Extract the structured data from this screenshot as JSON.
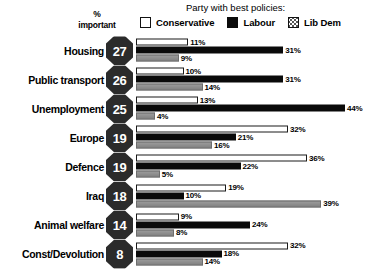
{
  "header": {
    "pct_important_line1": "%",
    "pct_important_line2": "important",
    "legend_title": "Party with best policies:",
    "legend": [
      {
        "label": "Conservative",
        "swatch": "white-square-outline-icon",
        "color": "#ffffff"
      },
      {
        "label": "Labour",
        "swatch": "black-square-icon",
        "color": "#0a0a0a"
      },
      {
        "label": "Lib Dem",
        "swatch": "dotted-square-icon",
        "color": "#8e8e8e"
      }
    ]
  },
  "chart_data": {
    "type": "bar",
    "title": "Party with best policies:",
    "xlabel": "",
    "ylabel": "",
    "xlim": [
      0,
      50
    ],
    "grid": false,
    "legend_position": "top",
    "orientation": "horizontal",
    "categories": [
      "Housing",
      "Public transport",
      "Unemployment",
      "Europe",
      "Defence",
      "Iraq",
      "Animal welfare",
      "Const/Devolution"
    ],
    "pct_important": [
      27,
      26,
      25,
      19,
      19,
      18,
      14,
      8
    ],
    "series": [
      {
        "name": "Conservative",
        "values": [
          11,
          10,
          13,
          32,
          36,
          19,
          9,
          32
        ]
      },
      {
        "name": "Labour",
        "values": [
          31,
          31,
          44,
          21,
          22,
          10,
          24,
          18
        ]
      },
      {
        "name": "Lib Dem",
        "values": [
          9,
          14,
          4,
          16,
          5,
          39,
          8,
          14
        ]
      }
    ],
    "value_labels": [
      [
        "11%",
        "31%",
        "9%"
      ],
      [
        "10%",
        "31%",
        "14%"
      ],
      [
        "13%",
        "44%",
        "4%"
      ],
      [
        "32%",
        "21%",
        "16%"
      ],
      [
        "36%",
        "22%",
        "5%"
      ],
      [
        "19%",
        "10%",
        "39%"
      ],
      [
        "9%",
        "24%",
        "8%"
      ],
      [
        "32%",
        "18%",
        "14%"
      ]
    ]
  }
}
